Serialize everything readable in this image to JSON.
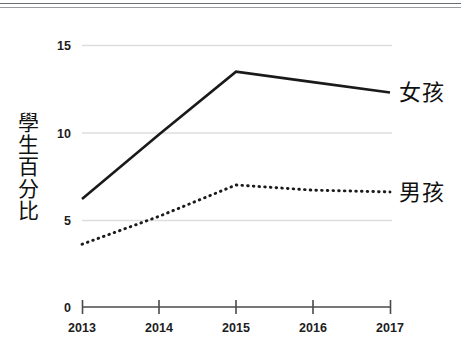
{
  "chart_data": {
    "type": "line",
    "title": "",
    "xlabel": "",
    "ylabel": "學生百分比",
    "x": [
      "2013",
      "2014",
      "2015",
      "2016",
      "2017"
    ],
    "categories": [
      "2013",
      "2014",
      "2015",
      "2016",
      "2017"
    ],
    "series": [
      {
        "name": "女孩",
        "style": "solid",
        "color": "#1a1a1a",
        "values": [
          6.2,
          9.9,
          13.5,
          12.9,
          12.3
        ]
      },
      {
        "name": "男孩",
        "style": "dotted",
        "color": "#1a1a1a",
        "values": [
          3.6,
          5.2,
          7.0,
          6.7,
          6.6
        ]
      }
    ],
    "ylim": [
      0,
      15
    ],
    "yticks": [
      0,
      5,
      10,
      15
    ],
    "ytick_labels": [
      "0",
      "5",
      "10",
      "15"
    ],
    "xlim": [
      "2013",
      "2017"
    ],
    "grid": true,
    "grid_color": "#dcdcdc",
    "legend_position": "right-of-line-ends",
    "axis_color": "#3a3a3a",
    "background": "#ffffff"
  },
  "axis": {
    "y_ticks": [
      {
        "label": "15",
        "value": 15
      },
      {
        "label": "10",
        "value": 10
      },
      {
        "label": "5",
        "value": 5
      },
      {
        "label": "0",
        "value": 0
      }
    ],
    "x_ticks": [
      {
        "label": "2013"
      },
      {
        "label": "2014"
      },
      {
        "label": "2015"
      },
      {
        "label": "2016"
      },
      {
        "label": "2017"
      }
    ]
  },
  "y_axis_title": {
    "full": "學生百分比",
    "chars": [
      "學",
      "生",
      "百",
      "分",
      "比"
    ]
  },
  "legend": {
    "girls": "女孩",
    "boys": "男孩"
  }
}
